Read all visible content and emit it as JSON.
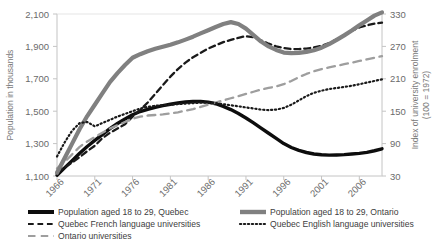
{
  "chart_data": {
    "type": "line",
    "title": "",
    "xlabel": "",
    "ylabel": "Population in thousands",
    "y2label": "Index of university enrolment (100 = 1972)",
    "xlim": [
      1966,
      2009
    ],
    "ylim": [
      1100,
      2100
    ],
    "y2lim": [
      30,
      330
    ],
    "grid": false,
    "legend_position": "bottom",
    "xticks": [
      "1966",
      "1971",
      "1976",
      "1981",
      "1986",
      "1991",
      "1996",
      "2001",
      "2006"
    ],
    "xtick_values": [
      1966,
      1971,
      1976,
      1981,
      1986,
      1991,
      1996,
      2001,
      2006
    ],
    "yticks": [
      "1,100",
      "1,300",
      "1,500",
      "1,700",
      "1,900",
      "2,100"
    ],
    "ytick_values": [
      1100,
      1300,
      1500,
      1700,
      1900,
      2100
    ],
    "y2ticks": [
      "30",
      "90",
      "150",
      "210",
      "270",
      "330"
    ],
    "y2tick_values": [
      30,
      90,
      150,
      210,
      270,
      330
    ],
    "x": [
      1966,
      1967,
      1968,
      1969,
      1970,
      1971,
      1972,
      1973,
      1974,
      1975,
      1976,
      1977,
      1978,
      1979,
      1980,
      1981,
      1982,
      1983,
      1984,
      1985,
      1986,
      1987,
      1988,
      1989,
      1990,
      1991,
      1992,
      1993,
      1994,
      1995,
      1996,
      1997,
      1998,
      1999,
      2000,
      2001,
      2002,
      2003,
      2004,
      2005,
      2006,
      2007,
      2008,
      2009
    ],
    "series": [
      {
        "name": "Population aged 18 to 29, Quebec",
        "axis": "left",
        "style": "solid",
        "color": "#0d0d0d",
        "width": 3.4,
        "values": [
          1105,
          1150,
          1195,
          1240,
          1282,
          1320,
          1356,
          1392,
          1424,
          1452,
          1478,
          1498,
          1512,
          1524,
          1534,
          1543,
          1551,
          1557,
          1560,
          1560,
          1556,
          1546,
          1530,
          1510,
          1486,
          1458,
          1428,
          1396,
          1364,
          1332,
          1300,
          1276,
          1258,
          1245,
          1236,
          1231,
          1229,
          1230,
          1232,
          1236,
          1240,
          1246,
          1256,
          1268
        ]
      },
      {
        "name": "Quebec French language universities",
        "axis": "right",
        "style": "dashed",
        "color": "#1a1a1a",
        "width": 2.3,
        "values": [
          38,
          46,
          55,
          65,
          76,
          86,
          100,
          110,
          118,
          126,
          140,
          152,
          166,
          182,
          198,
          214,
          228,
          240,
          250,
          258,
          266,
          272,
          278,
          282,
          286,
          289,
          287,
          281,
          275,
          270,
          267,
          265,
          265,
          266,
          268,
          271,
          276,
          283,
          291,
          299,
          305,
          309,
          312,
          314
        ]
      },
      {
        "name": "Ontario universities",
        "axis": "right",
        "style": "dashed-long",
        "color": "#9e9e9e",
        "width": 2.3,
        "values": [
          44,
          56,
          70,
          84,
          94,
          102,
          110,
          118,
          124,
          130,
          136,
          140,
          142,
          143,
          144,
          146,
          148,
          151,
          154,
          158,
          162,
          166,
          170,
          174,
          178,
          182,
          186,
          190,
          193,
          196,
          200,
          206,
          213,
          219,
          224,
          228,
          231,
          234,
          237,
          240,
          243,
          246,
          249,
          252
        ]
      },
      {
        "name": "Population aged 18 to 29, Ontario",
        "axis": "left",
        "style": "solid",
        "color": "#808080",
        "width": 4.2,
        "values": [
          1120,
          1210,
          1300,
          1390,
          1470,
          1540,
          1610,
          1680,
          1735,
          1785,
          1830,
          1852,
          1870,
          1885,
          1898,
          1910,
          1925,
          1942,
          1960,
          1980,
          2000,
          2020,
          2038,
          2050,
          2038,
          2010,
          1970,
          1930,
          1900,
          1878,
          1862,
          1858,
          1860,
          1866,
          1876,
          1892,
          1914,
          1940,
          1968,
          1998,
          2030,
          2060,
          2090,
          2110
        ]
      },
      {
        "name": "Quebec English language universities",
        "axis": "right",
        "style": "dotted",
        "color": "#1a1a1a",
        "width": 2.2,
        "values": [
          66,
          92,
          114,
          128,
          130,
          122,
          128,
          134,
          140,
          145,
          150,
          155,
          158,
          160,
          161,
          162,
          163,
          164,
          165,
          166,
          166,
          165,
          163,
          161,
          159,
          157,
          155,
          153,
          152,
          153,
          156,
          162,
          170,
          178,
          184,
          188,
          191,
          193,
          195,
          197,
          200,
          203,
          206,
          209
        ]
      }
    ]
  },
  "legend": {
    "entries": [
      {
        "label": "Population aged 18 to 29, Quebec",
        "style": "solid",
        "color": "#0d0d0d",
        "width": 4,
        "col": 1
      },
      {
        "label": "Quebec French language universities",
        "style": "dashed",
        "color": "#1a1a1a",
        "width": 2.2,
        "col": 1
      },
      {
        "label": "Ontario universities",
        "style": "dashed-long",
        "color": "#9e9e9e",
        "width": 2.2,
        "col": 1
      },
      {
        "label": "Population aged 18 to 29, Ontario",
        "style": "solid",
        "color": "#808080",
        "width": 4.4,
        "col": 2
      },
      {
        "label": "Quebec English language universities",
        "style": "dotted",
        "color": "#1a1a1a",
        "width": 2.2,
        "col": 2
      }
    ]
  }
}
